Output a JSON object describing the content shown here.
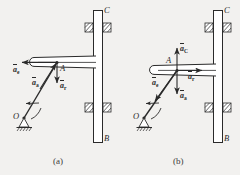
{
  "figure": {
    "background_color": "#f2f1ef",
    "line_color": "#2a2a2a",
    "panels": [
      {
        "id": "a",
        "caption": "(a)",
        "points": [
          {
            "name": "point-label-O",
            "text": "O"
          },
          {
            "name": "point-label-A",
            "text": "A"
          },
          {
            "name": "point-label-B",
            "text": "B"
          },
          {
            "name": "point-label-C",
            "text": "C"
          }
        ],
        "vectors": [
          {
            "name": "vector-ae",
            "symbol": "a",
            "subscript": "e",
            "direction": "left"
          },
          {
            "name": "vector-aa",
            "symbol": "a",
            "subscript": "a",
            "direction": "up-right-along-rod"
          },
          {
            "name": "vector-ar",
            "symbol": "a",
            "subscript": "r",
            "direction": "down"
          }
        ]
      },
      {
        "id": "b",
        "caption": "(b)",
        "points": [
          {
            "name": "point-label-O",
            "text": "O"
          },
          {
            "name": "point-label-A",
            "text": "A"
          },
          {
            "name": "point-label-B",
            "text": "B"
          },
          {
            "name": "point-label-C",
            "text": "C"
          }
        ],
        "vectors": [
          {
            "name": "vector-aC",
            "symbol": "a",
            "subscript": "C",
            "direction": "up"
          },
          {
            "name": "vector-ar",
            "symbol": "a",
            "subscript": "r",
            "direction": "right"
          },
          {
            "name": "vector-aa",
            "symbol": "a",
            "subscript": "a",
            "direction": "down"
          },
          {
            "name": "vector-ae",
            "symbol": "a",
            "subscript": "e",
            "direction": "down-left-along-rod"
          }
        ]
      }
    ]
  },
  "labels": {
    "a": {
      "O": "O",
      "A": "A",
      "B": "B",
      "C": "C",
      "ae": "a",
      "ae_sub": "e",
      "aa": "a",
      "aa_sub": "a",
      "ar": "a",
      "ar_sub": "r",
      "caption": "(a)"
    },
    "b": {
      "O": "O",
      "A": "A",
      "B": "B",
      "C": "C",
      "aC": "a",
      "aC_sub": "C",
      "ar": "a",
      "ar_sub": "r",
      "aa": "a",
      "aa_sub": "a",
      "ae": "a",
      "ae_sub": "e",
      "caption": "(b)"
    }
  }
}
